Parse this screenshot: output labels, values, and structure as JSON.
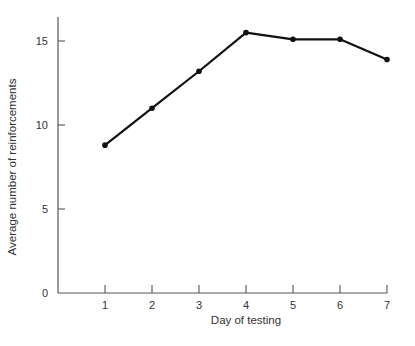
{
  "chart_data": {
    "type": "line",
    "title": "",
    "xlabel": "Day of testing",
    "ylabel": "Average number of reinforcements",
    "x": [
      1,
      2,
      3,
      4,
      5,
      6,
      7
    ],
    "series": [
      {
        "name": "Average reinforcements",
        "values": [
          8.8,
          11.0,
          13.2,
          15.5,
          15.1,
          15.1,
          13.9
        ]
      }
    ],
    "xticks": [
      "1",
      "2",
      "3",
      "4",
      "5",
      "6",
      "7"
    ],
    "yticks": [
      "0",
      "5",
      "10",
      "15"
    ],
    "xlim": [
      0,
      7
    ],
    "ylim": [
      0,
      16
    ],
    "grid": false,
    "legend": "none",
    "line_color": "#111111",
    "axis_color": "#555555"
  }
}
